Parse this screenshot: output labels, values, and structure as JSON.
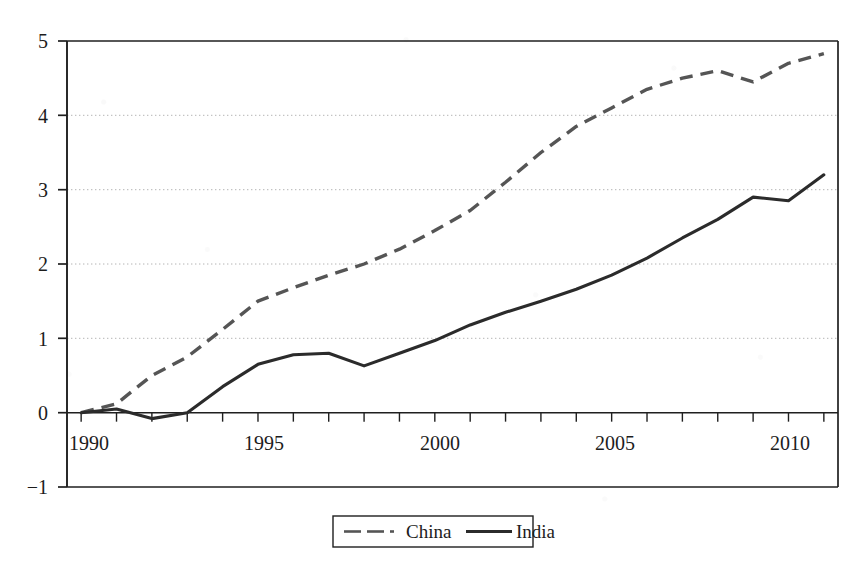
{
  "chart_data": {
    "type": "line",
    "title": "",
    "subtitle": "",
    "xlabel": "",
    "ylabel": "",
    "xlim": [
      1989.6,
      2011.4
    ],
    "ylim": [
      -1,
      5
    ],
    "grid": true,
    "grid_style": "dotted-horizontal",
    "legend_position": "bottom-center",
    "x": [
      1990,
      1991,
      1992,
      1993,
      1994,
      1995,
      1996,
      1997,
      1998,
      1999,
      2000,
      2001,
      2002,
      2003,
      2004,
      2005,
      2006,
      2007,
      2008,
      2009,
      2010,
      2011
    ],
    "xticks": [
      1990,
      1995,
      2000,
      2005,
      2010
    ],
    "xticklabels": [
      "1990",
      "1995",
      "2000",
      "2005",
      "2010"
    ],
    "xminor_ticks_every": 1,
    "yticks": [
      -1,
      0,
      1,
      2,
      3,
      4,
      5
    ],
    "yticklabels": [
      "−1",
      "0",
      "1",
      "2",
      "3",
      "4",
      "5"
    ],
    "series": [
      {
        "name": "China",
        "style": "dashed",
        "color": "#555555",
        "values": [
          0.0,
          0.12,
          0.5,
          0.75,
          1.12,
          1.5,
          1.68,
          1.85,
          2.0,
          2.2,
          2.45,
          2.72,
          3.1,
          3.5,
          3.85,
          4.1,
          4.35,
          4.5,
          4.6,
          4.45,
          4.7,
          4.83
        ]
      },
      {
        "name": "India",
        "style": "solid",
        "color": "#2b2b2b",
        "values": [
          0.0,
          0.05,
          -0.08,
          0.0,
          0.35,
          0.65,
          0.78,
          0.8,
          0.63,
          0.8,
          0.97,
          1.18,
          1.35,
          1.5,
          1.66,
          1.85,
          2.08,
          2.35,
          2.6,
          2.9,
          2.85,
          3.2
        ]
      }
    ]
  },
  "axes": {
    "y_tick_labels": [
      "5",
      "4",
      "3",
      "2",
      "1",
      "0",
      "−1"
    ],
    "x_tick_labels": [
      "1990",
      "1995",
      "2000",
      "2005",
      "2010"
    ]
  },
  "legend": {
    "entries": [
      {
        "label": "China",
        "style": "dashed"
      },
      {
        "label": "India",
        "style": "solid"
      }
    ]
  },
  "colors": {
    "china_line": "#555555",
    "india_line": "#2b2b2b",
    "axis": "#1f1f1f",
    "grid": "#b4b4b4",
    "background": "#ffffff"
  }
}
